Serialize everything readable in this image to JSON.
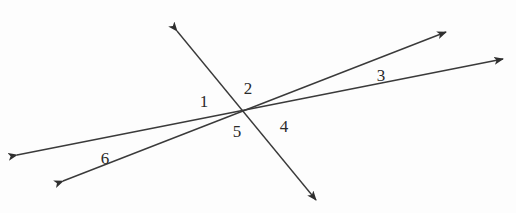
{
  "diagram": {
    "type": "intersecting-lines-angles",
    "intersection": {
      "x": 243,
      "y": 111
    },
    "line_color": "#3a3a3a",
    "label_color": "#2a2a2a",
    "lines": [
      {
        "name": "transversal-line",
        "from": {
          "x": 177,
          "y": 31
        },
        "to": {
          "x": 316,
          "y": 200
        }
      },
      {
        "name": "line-a",
        "from": {
          "x": 17,
          "y": 155
        },
        "to": {
          "x": 503,
          "y": 59
        }
      },
      {
        "name": "line-b",
        "from": {
          "x": 63,
          "y": 181
        },
        "to": {
          "x": 446,
          "y": 32
        }
      }
    ],
    "angle_labels": [
      {
        "text": "1",
        "x": 204,
        "y": 101
      },
      {
        "text": "2",
        "x": 248,
        "y": 88
      },
      {
        "text": "3",
        "x": 381,
        "y": 75
      },
      {
        "text": "4",
        "x": 284,
        "y": 126
      },
      {
        "text": "5",
        "x": 237,
        "y": 131
      },
      {
        "text": "6",
        "x": 105,
        "y": 158
      }
    ]
  }
}
